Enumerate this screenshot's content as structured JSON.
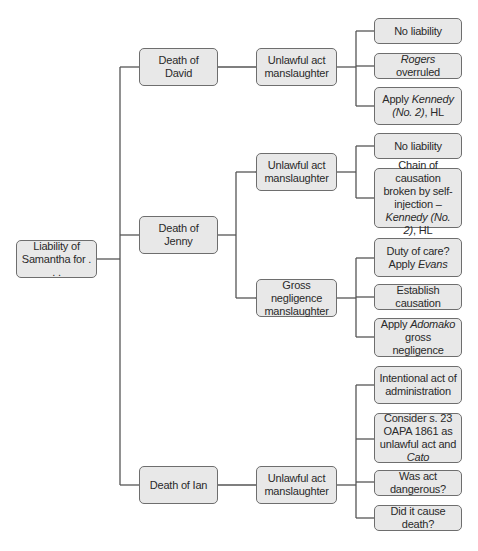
{
  "root": {
    "label": "Liability of Samantha for . . ."
  },
  "branches": [
    {
      "label": "Death of David",
      "offences": [
        {
          "label": "Unlawful act manslaughter",
          "points": [
            {
              "parts": [
                {
                  "t": "No liability"
                }
              ]
            },
            {
              "parts": [
                {
                  "t": "Rogers",
                  "i": true
                },
                {
                  "t": " overruled"
                }
              ]
            },
            {
              "parts": [
                {
                  "t": "Apply "
                },
                {
                  "t": "Kennedy (No. 2)",
                  "i": true
                },
                {
                  "t": ", HL"
                }
              ]
            }
          ]
        }
      ]
    },
    {
      "label": "Death of Jenny",
      "offences": [
        {
          "label": "Unlawful act manslaughter",
          "points": [
            {
              "parts": [
                {
                  "t": "No liability"
                }
              ]
            },
            {
              "parts": [
                {
                  "t": "Chain of causation broken by self-injection – "
                },
                {
                  "t": "Kennedy (No. 2)",
                  "i": true
                },
                {
                  "t": ", HL"
                }
              ]
            }
          ]
        },
        {
          "label": "Gross negligence manslaughter",
          "points": [
            {
              "parts": [
                {
                  "t": "Duty of care? Apply "
                },
                {
                  "t": "Evans",
                  "i": true
                }
              ]
            },
            {
              "parts": [
                {
                  "t": "Establish causation"
                }
              ]
            },
            {
              "parts": [
                {
                  "t": "Apply "
                },
                {
                  "t": "Adomako",
                  "i": true
                },
                {
                  "t": " gross negligence"
                }
              ]
            }
          ]
        }
      ]
    },
    {
      "label": "Death of Ian",
      "offences": [
        {
          "label": "Unlawful act manslaughter",
          "points": [
            {
              "parts": [
                {
                  "t": "Intentional act of administration"
                }
              ]
            },
            {
              "parts": [
                {
                  "t": "Consider s. 23 OAPA 1861 as unlawful act and "
                },
                {
                  "t": "Cato",
                  "i": true
                }
              ]
            },
            {
              "parts": [
                {
                  "t": "Was act dangerous?"
                }
              ]
            },
            {
              "parts": [
                {
                  "t": "Did it cause death?"
                }
              ]
            }
          ]
        }
      ]
    }
  ],
  "colors": {
    "box_fill": "#e8e8e8",
    "box_border": "#6e6e6e",
    "line": "#555555",
    "text": "#2a2a2a"
  }
}
